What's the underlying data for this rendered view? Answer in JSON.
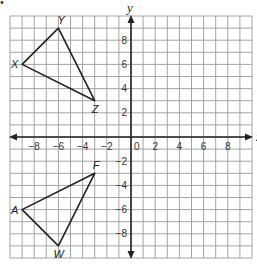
{
  "bullet": "•",
  "axes": {
    "x_label": "x",
    "y_label": "y",
    "range": {
      "xmin": -10,
      "xmax": 10,
      "ymin": -10,
      "ymax": 10
    },
    "x_ticks": [
      "-8",
      "-6",
      "-4",
      "-2",
      "0",
      "2",
      "4",
      "6",
      "8"
    ],
    "y_ticks": [
      "8",
      "6",
      "4",
      "2",
      "-2",
      "-4",
      "-6",
      "-8"
    ]
  },
  "triangles": [
    {
      "name": "XYZ",
      "vertices": [
        {
          "label": "X",
          "x": -9,
          "y": 6
        },
        {
          "label": "Y",
          "x": -6,
          "y": 9
        },
        {
          "label": "Z",
          "x": -3,
          "y": 3
        }
      ]
    },
    {
      "name": "AFW",
      "vertices": [
        {
          "label": "A",
          "x": -9,
          "y": -6
        },
        {
          "label": "F",
          "x": -3,
          "y": -3
        },
        {
          "label": "W",
          "x": -6,
          "y": -9
        }
      ]
    }
  ],
  "colors": {
    "grid": "#9a9a9a",
    "axis": "#222222",
    "triangle": "#222222",
    "background": "#ffffff"
  }
}
